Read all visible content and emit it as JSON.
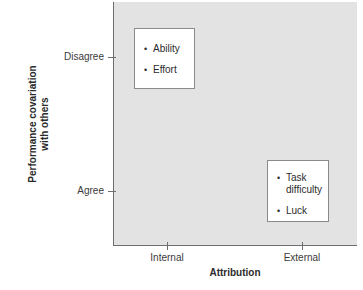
{
  "chart_data": {
    "type": "scatter",
    "title": "",
    "xlabel": "Attribution",
    "ylabel": "Performance covariation\nwith others",
    "ylabel_line1": "Performance covariation",
    "ylabel_line2": "with others",
    "x_ticks": [
      "Internal",
      "External"
    ],
    "y_ticks": [
      "Disagree",
      "Agree"
    ],
    "grid": false,
    "legend": "none",
    "plot_background": "#e3e3e3",
    "axis_color": "#6d6d6d",
    "annotations": [
      {
        "x": "Internal",
        "y": "Disagree",
        "items": [
          "Ability",
          "Effort"
        ]
      },
      {
        "x": "External",
        "y": "Agree",
        "items": [
          "Task\ndifficulty",
          "Luck"
        ]
      }
    ]
  },
  "axes": {
    "x_title": "Attribution",
    "y_title_line1": "Performance covariation",
    "y_title_line2": "with others",
    "x_tick_internal": "Internal",
    "x_tick_external": "External",
    "y_tick_disagree": "Disagree",
    "y_tick_agree": "Agree"
  },
  "boxes": {
    "internal_disagree": {
      "item1": "Ability",
      "item2": "Effort"
    },
    "external_agree": {
      "item1": "Task\ndifficulty",
      "item2": "Luck"
    }
  }
}
